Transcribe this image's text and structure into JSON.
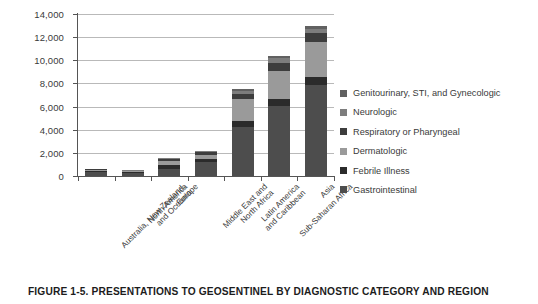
{
  "caption": "FIGURE 1-5.  PRESENTATIONS TO GEOSENTINEL BY DIAGNOSTIC CATEGORY AND REGION",
  "chart_data": {
    "type": "bar",
    "subtype": "stacked-vertical",
    "title": "FIGURE 1-5.  PRESENTATIONS TO GEOSENTINEL BY DIAGNOSTIC CATEGORY AND REGION",
    "xlabel": "",
    "ylabel": "",
    "ylim": [
      0,
      14000
    ],
    "ytick_labels": [
      "14,000",
      "12,000",
      "10,000",
      "8,000",
      "6,000",
      "4,000",
      "2,000",
      "0"
    ],
    "ytick_values": [
      14000,
      12000,
      10000,
      8000,
      6000,
      4000,
      2000,
      0
    ],
    "grid": true,
    "grid_axis": "y",
    "legend_position": "right",
    "categories": [
      "Australia, New Zealand, and Oceania",
      "North America",
      "Europe",
      "Middle East and North Africa",
      "Latin America and Caribbean",
      "Sub-Saharan Africa",
      "Asia"
    ],
    "series": [
      {
        "name": "Gastrointestinal",
        "color": "#4d4d4d",
        "values": [
          330,
          260,
          640,
          1250,
          4250,
          6050,
          7900
        ]
      },
      {
        "name": "Febrile Illness",
        "color": "#2b2b2b",
        "values": [
          90,
          70,
          280,
          230,
          480,
          600,
          620
        ]
      },
      {
        "name": "Dermatologic",
        "color": "#9a9a9a",
        "values": [
          130,
          100,
          410,
          380,
          1900,
          2400,
          3100
        ]
      },
      {
        "name": "Respiratory or Pharyngeal",
        "color": "#3d3d3d",
        "values": [
          50,
          40,
          130,
          180,
          450,
          700,
          750
        ]
      },
      {
        "name": "Neurologic",
        "color": "#7d7d7d",
        "values": [
          30,
          20,
          90,
          110,
          280,
          430,
          380
        ]
      },
      {
        "name": "Genitourinary, STI, and Gynecologic",
        "color": "#616161",
        "values": [
          20,
          10,
          50,
          50,
          140,
          220,
          250
        ]
      }
    ],
    "totals": [
      650,
      500,
      1600,
      2200,
      7500,
      10400,
      13000
    ],
    "legend": [
      "Genitourinary, STI, and Gynecologic",
      "Neurologic",
      "Respiratory or Pharyngeal",
      "Dermatologic",
      "Febrile Illness",
      "Gastrointestinal"
    ]
  }
}
